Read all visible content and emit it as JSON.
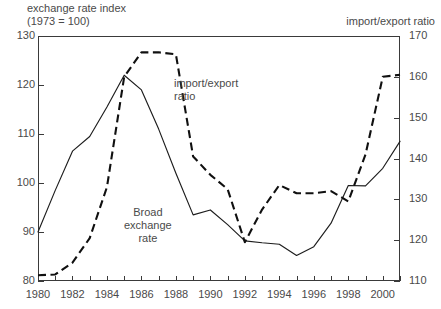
{
  "header": {
    "left_title_line1": "exchange rate index",
    "left_title_line2": "(1973 = 100)",
    "right_title": "import/export ratio"
  },
  "annotations": {
    "import_export": "import/export\nratio",
    "broad_exchange": "Broad\nexchange\nrate"
  },
  "axes": {
    "left_ticks": [
      "130",
      "120",
      "110",
      "100",
      "90",
      "80"
    ],
    "right_ticks": [
      "170",
      "160",
      "150",
      "140",
      "130",
      "120",
      "110"
    ],
    "x_ticks": [
      "1980",
      "1982",
      "1984",
      "1986",
      "1988",
      "1990",
      "1992",
      "1994",
      "1996",
      "1998",
      "2000"
    ]
  },
  "chart_data": {
    "type": "line",
    "title": "",
    "subtitle": "",
    "xlabel": "",
    "ylabel": "exchange rate index (1973 = 100)",
    "y2label": "import/export ratio",
    "xlim": [
      1980,
      2001
    ],
    "ylim": [
      80,
      130
    ],
    "y2lim": [
      110,
      170
    ],
    "grid": false,
    "legend": "inline-annotations",
    "x": [
      1980,
      1981,
      1982,
      1983,
      1984,
      1985,
      1986,
      1987,
      1988,
      1989,
      1990,
      1991,
      1992,
      1993,
      1994,
      1995,
      1996,
      1997,
      1998,
      1999,
      2000,
      2001
    ],
    "series": [
      {
        "name": "Broad exchange rate",
        "axis": "left",
        "style": "solid",
        "color": "#1d1d1d",
        "values": [
          90.0,
          98.5,
          106.5,
          109.5,
          115.5,
          122.0,
          119.0,
          111.0,
          102.0,
          93.5,
          94.5,
          91.5,
          88.2,
          87.8,
          87.5,
          85.2,
          87.0,
          91.8,
          99.5,
          99.4,
          103.0,
          108.5
        ]
      },
      {
        "name": "import/export ratio",
        "axis": "right",
        "style": "dashed",
        "color": "#101010",
        "values": [
          111.4,
          111.6,
          114.5,
          120.5,
          133.0,
          160.0,
          166.0,
          166.0,
          165.5,
          140.5,
          136.0,
          132.5,
          119.5,
          127.5,
          133.5,
          131.5,
          131.5,
          132.0,
          129.5,
          141.0,
          160.0,
          160.5
        ]
      }
    ]
  }
}
